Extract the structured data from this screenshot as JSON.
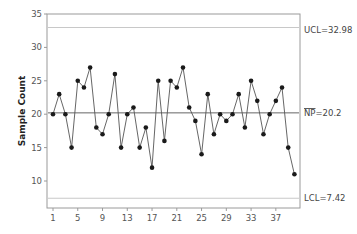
{
  "chart_data": {
    "type": "line",
    "title": "",
    "xlabel": "",
    "ylabel": "Sample Count",
    "xlim": [
      0,
      41
    ],
    "ylim": [
      6,
      35
    ],
    "x_ticks": [
      1,
      5,
      9,
      13,
      17,
      21,
      25,
      29,
      33,
      37
    ],
    "y_ticks": [
      10,
      15,
      20,
      25,
      30,
      35
    ],
    "grid": false,
    "legend": null,
    "x": [
      1,
      2,
      3,
      4,
      5,
      6,
      7,
      8,
      9,
      10,
      11,
      12,
      13,
      14,
      15,
      16,
      17,
      18,
      19,
      20,
      21,
      22,
      23,
      24,
      25,
      26,
      27,
      28,
      29,
      30,
      31,
      32,
      33,
      34,
      35,
      36,
      37,
      38,
      39,
      40
    ],
    "series": [
      {
        "name": "Sample Count",
        "values": [
          20,
          23,
          20,
          15,
          25,
          24,
          27,
          18,
          17,
          20,
          26,
          15,
          20,
          21,
          15,
          18,
          12,
          25,
          16,
          25,
          24,
          27,
          21,
          19,
          14,
          23,
          17,
          20,
          19,
          20,
          23,
          18,
          25,
          22,
          17,
          20,
          22,
          24,
          15,
          11
        ]
      }
    ],
    "control_lines": [
      {
        "name": "UCL",
        "label": "UCL=32.98",
        "value": 32.98
      },
      {
        "name": "NP",
        "label": "NP=20.2",
        "value": 20.2
      },
      {
        "name": "LCL",
        "label": "LCL=7.42",
        "value": 7.42
      }
    ]
  },
  "labels": {
    "ylabel": "Sample Count",
    "ucl": "UCL=32.98",
    "np_bar": "NP",
    "np_rest": "=20.2",
    "lcl": "LCL=7.42"
  }
}
